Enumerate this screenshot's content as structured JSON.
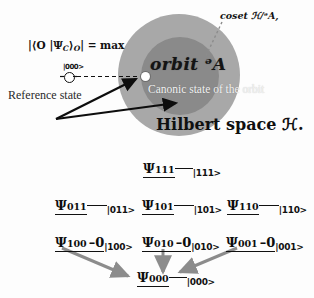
{
  "top_panel": {
    "outer_region_label": "Hilbert space ℋ.",
    "inner_region_label": "orbit ᵊA",
    "coset_label": "coset ℋ/ᵊA,",
    "canonic_state_label": "Canonic state of the orbit",
    "reference_state_label": "Reference state",
    "reference_state_ket": "|000>",
    "maximality_condition": "|⟨O |Ψ",
    "maximality_sub_c": "C",
    "maximality_mid": "⟩",
    "maximality_sub_o": "O",
    "maximality_tail": "| = max",
    "colors": {
      "outer_disc": "#a8a8a8",
      "inner_disc": "#8a8a8a",
      "canonic_dot": "#ffffff",
      "arrow_black": "#0d0d0d",
      "coset_dotted": "#777777"
    }
  },
  "lattice": {
    "arrow_color": "#8c8c8c",
    "levels": [
      {
        "level": 3,
        "nodes": [
          {
            "psi": "Ψ",
            "index": "111",
            "zero": "",
            "ket": "|111>"
          }
        ]
      },
      {
        "level": 2,
        "nodes": [
          {
            "psi": "Ψ",
            "index": "011",
            "zero": "",
            "ket": "|011>"
          },
          {
            "psi": "Ψ",
            "index": "101",
            "zero": "",
            "ket": "|101>"
          },
          {
            "psi": "Ψ",
            "index": "110",
            "zero": "",
            "ket": "|110>"
          }
        ]
      },
      {
        "level": 1,
        "nodes": [
          {
            "psi": "Ψ",
            "index": "100",
            "zero": "–0",
            "ket": "|100>"
          },
          {
            "psi": "Ψ",
            "index": "010",
            "zero": "–0",
            "ket": "|010>"
          },
          {
            "psi": "Ψ",
            "index": "001",
            "zero": "–0",
            "ket": "|001>"
          }
        ]
      },
      {
        "level": 0,
        "nodes": [
          {
            "psi": "Ψ",
            "index": "000",
            "zero": "",
            "ket": "|000>"
          }
        ]
      }
    ]
  }
}
